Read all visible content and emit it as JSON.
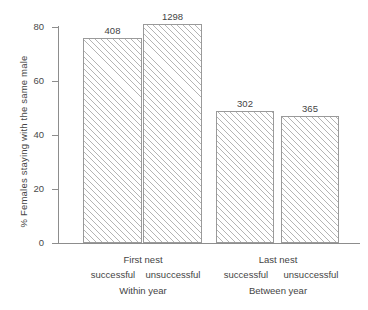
{
  "chart_data": {
    "type": "bar",
    "title": "",
    "xlabel": "",
    "ylabel": "% Females staying with the same male",
    "ylim": [
      0,
      80
    ],
    "yticks": [
      0,
      20,
      40,
      60,
      80
    ],
    "grid": false,
    "legend": null,
    "categories": [
      "successful",
      "unsuccessful",
      "successful",
      "unsuccessful"
    ],
    "values": [
      76,
      81,
      49,
      47
    ],
    "bar_labels": [
      "408",
      "1298",
      "302",
      "365"
    ],
    "bar_label_meaning": "sample size",
    "groups": [
      {
        "nest_label": "First nest",
        "period_label": "Within year",
        "bars": [
          0,
          1
        ]
      },
      {
        "nest_label": "Last nest",
        "period_label": "Between year",
        "bars": [
          2,
          3
        ]
      }
    ]
  },
  "axis": {
    "y": {
      "title": "% Females staying with the same male",
      "ticks": [
        {
          "value": "80"
        },
        {
          "value": "60"
        },
        {
          "value": "40"
        },
        {
          "value": "20"
        },
        {
          "value": "0"
        }
      ]
    },
    "x": {
      "tier1": [
        {
          "label": "First nest"
        },
        {
          "label": "Last nest"
        }
      ],
      "tier2": [
        {
          "label": "successful"
        },
        {
          "label": "unsuccessful"
        },
        {
          "label": "successful"
        },
        {
          "label": "unsuccessful"
        }
      ],
      "tier3": [
        {
          "label": "Within year"
        },
        {
          "label": "Between year"
        }
      ]
    }
  },
  "colors": {
    "axis": "#8d8d8d",
    "bar_outline": "#9a9a9a",
    "hatch": "#b4b4b4",
    "text": "#444444",
    "background": "#ffffff"
  }
}
